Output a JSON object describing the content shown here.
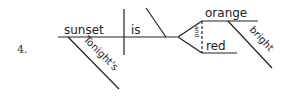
{
  "diagram": {
    "type": "sentence-diagram",
    "item_number": "4.",
    "subject": "sunset",
    "subject_modifier": "Tonight's",
    "verb": "is",
    "compound_predicate_adjectives": [
      "orange",
      "red"
    ],
    "conjunction": "and",
    "adjective_modifier": "bright"
  }
}
